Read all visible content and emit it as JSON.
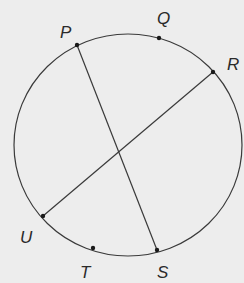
{
  "diagram": {
    "type": "circle-with-chords",
    "colors": {
      "background": "#ededed",
      "stroke": "#3a3a3a",
      "point": "#1a1a1a",
      "label": "#2a2a2a"
    },
    "circle": {
      "cx": 128,
      "cy": 145,
      "rx": 114,
      "ry": 111
    },
    "points": [
      {
        "id": "P",
        "label": "P",
        "x": 77,
        "y": 45,
        "label_x": 60,
        "label_y": 38
      },
      {
        "id": "Q",
        "label": "Q",
        "x": 159,
        "y": 38,
        "label_x": 157,
        "label_y": 24
      },
      {
        "id": "R",
        "label": "R",
        "x": 213,
        "y": 72,
        "label_x": 227,
        "label_y": 70
      },
      {
        "id": "U",
        "label": "U",
        "x": 43,
        "y": 216,
        "label_x": 20,
        "label_y": 243
      },
      {
        "id": "T",
        "label": "T",
        "x": 93,
        "y": 248,
        "label_x": 80,
        "label_y": 278
      },
      {
        "id": "S",
        "label": "S",
        "x": 157,
        "y": 250,
        "label_x": 157,
        "label_y": 278
      }
    ],
    "chords": [
      {
        "id": "PS",
        "from": "P",
        "to": "S",
        "x1": 77,
        "y1": 45,
        "x2": 157,
        "y2": 250
      },
      {
        "id": "RU",
        "from": "R",
        "to": "U",
        "x1": 213,
        "y1": 72,
        "x2": 43,
        "y2": 216
      }
    ],
    "intersection": {
      "x": 118,
      "y": 151
    }
  }
}
